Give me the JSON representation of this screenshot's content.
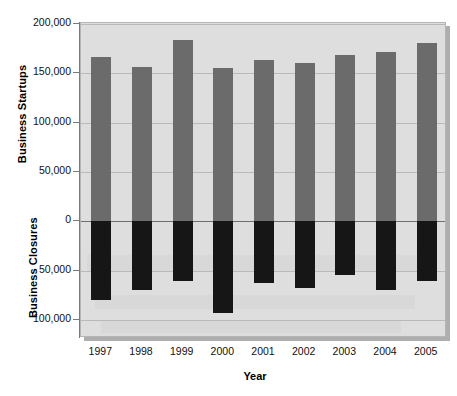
{
  "chart_data": {
    "type": "bar",
    "title": "",
    "xlabel": "Year",
    "ylabel_top": "Business Startups",
    "ylabel_bottom": "Business Closures",
    "categories": [
      "1997",
      "1998",
      "1999",
      "2000",
      "2001",
      "2002",
      "2003",
      "2004",
      "2005"
    ],
    "series": [
      {
        "name": "Business Startups",
        "color": "#6b6b6b",
        "values": [
          167000,
          156000,
          184000,
          155000,
          164000,
          161000,
          169000,
          172000,
          181000
        ]
      },
      {
        "name": "Business Closures",
        "color": "#161616",
        "values": [
          -80000,
          -70000,
          -61000,
          -93000,
          -63000,
          -68000,
          -54000,
          -70000,
          -61000
        ]
      }
    ],
    "ylim": [
      -100000,
      200000
    ],
    "ytick_values": [
      200000,
      150000,
      100000,
      50000,
      0,
      -50000,
      -100000
    ],
    "ytick_labels": [
      "200,000",
      "150,000",
      "100,000",
      "50,000",
      "0",
      "50,000",
      "100,000"
    ],
    "grid": true,
    "legend": "none",
    "plot_background": "#dedede",
    "gridline_color": "#b9b9b9",
    "zeroline_color": "#6f6f6f"
  }
}
